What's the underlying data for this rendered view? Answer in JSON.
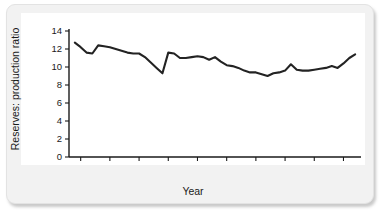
{
  "figure": {
    "accent_color": "#232323",
    "frame_color": "#f2f2f2",
    "plot_background": "#ffffff"
  },
  "chart_data": {
    "type": "line",
    "title": "",
    "subtitle": "",
    "xlabel": "Year",
    "ylabel": "Reserves: production ratio",
    "xlim": [
      1953,
      2003
    ],
    "ylim": [
      0,
      14
    ],
    "xticks": [
      1955,
      1960,
      1965,
      1970,
      1975,
      1980,
      1985,
      1990,
      1995,
      2000
    ],
    "xtick_labels": [
      "1955",
      "1960",
      "1965",
      "1970",
      "1975",
      "1980",
      "1985",
      "1990",
      "1995",
      "2000"
    ],
    "yticks": [
      0,
      2,
      4,
      6,
      8,
      10,
      12,
      14
    ],
    "ytick_labels": [
      "0",
      "2",
      "4",
      "6",
      "8",
      "10",
      "12",
      "14"
    ],
    "grid": false,
    "legend": null,
    "legend_position": "none",
    "series": [
      {
        "name": "Reserves: production ratio",
        "color": "#232323",
        "x": [
          1954,
          1955,
          1956,
          1957,
          1958,
          1959,
          1960,
          1961,
          1962,
          1963,
          1964,
          1965,
          1966,
          1967,
          1968,
          1969,
          1970,
          1971,
          1972,
          1973,
          1974,
          1975,
          1976,
          1977,
          1978,
          1979,
          1980,
          1981,
          1982,
          1983,
          1984,
          1985,
          1986,
          1987,
          1988,
          1989,
          1990,
          1991,
          1992,
          1993,
          1994,
          1995,
          1996,
          1997,
          1998,
          1999,
          2000,
          2001,
          2002
        ],
        "y": [
          12.7,
          12.2,
          11.6,
          11.5,
          12.4,
          12.3,
          12.2,
          12.0,
          11.8,
          11.6,
          11.5,
          11.5,
          11.1,
          10.5,
          9.9,
          9.3,
          11.6,
          11.5,
          11.0,
          11.0,
          11.1,
          11.2,
          11.1,
          10.8,
          11.1,
          10.6,
          10.2,
          10.1,
          9.9,
          9.6,
          9.4,
          9.4,
          9.2,
          9.0,
          9.3,
          9.4,
          9.6,
          10.3,
          9.7,
          9.6,
          9.6,
          9.7,
          9.8,
          9.9,
          10.1,
          9.9,
          10.4,
          11.0,
          11.4
        ]
      }
    ]
  }
}
